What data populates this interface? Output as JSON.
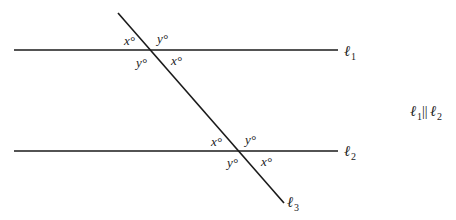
{
  "diagram": {
    "type": "parallel-lines-transversal",
    "lines": [
      {
        "id": "l1",
        "label": "ℓ",
        "subscript": "1"
      },
      {
        "id": "l2",
        "label": "ℓ",
        "subscript": "2"
      },
      {
        "id": "l3",
        "label": "ℓ",
        "subscript": "3"
      }
    ],
    "intersection_top": {
      "upper_left": "x°",
      "upper_right": "y°",
      "lower_left": "y°",
      "lower_right": "x°"
    },
    "intersection_bottom": {
      "upper_left": "x°",
      "upper_right": "y°",
      "lower_left": "y°",
      "lower_right": "x°"
    },
    "relation": {
      "left": "ℓ",
      "left_sub": "1",
      "symbol": "||",
      "right": "ℓ",
      "right_sub": "2"
    },
    "colors": {
      "line": "#1a1a1a",
      "text": "#222222"
    }
  }
}
